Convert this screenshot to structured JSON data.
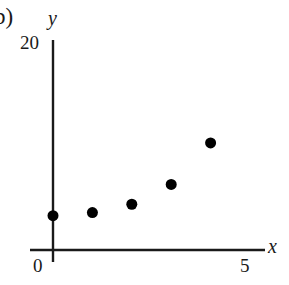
{
  "panel": {
    "label": "b)"
  },
  "chart_data": {
    "type": "scatter",
    "title": "",
    "subtitle": "",
    "xlabel": "x",
    "ylabel": "y",
    "x": [
      0,
      1,
      2,
      3,
      4
    ],
    "values": [
      3.3,
      3.6,
      4.4,
      6.3,
      10.3
    ],
    "series": [
      {
        "name": "",
        "points": [
          {
            "x": 0,
            "y": 3.3
          },
          {
            "x": 1,
            "y": 3.6
          },
          {
            "x": 2,
            "y": 4.4
          },
          {
            "x": 3,
            "y": 6.3
          },
          {
            "x": 4,
            "y": 10.3
          }
        ]
      }
    ],
    "xlim": [
      0,
      5
    ],
    "ylim": [
      0,
      20
    ],
    "x_ticks": [
      "0",
      "5"
    ],
    "x_tick_values": [
      0,
      5
    ],
    "y_ticks": [
      "20"
    ],
    "y_tick_values": [
      20
    ],
    "grid": false,
    "legend": false,
    "legend_position": "none",
    "marker": "filled-circle",
    "marker_color": "#000000",
    "marker_size": 11,
    "axis_color": "#1a1a1a",
    "background_color": "#ffffff",
    "annotations": []
  },
  "axes": {
    "y_label": "y",
    "x_label": "x",
    "y_tick_top": "20",
    "x_tick_origin": "0",
    "x_tick_right": "5"
  }
}
